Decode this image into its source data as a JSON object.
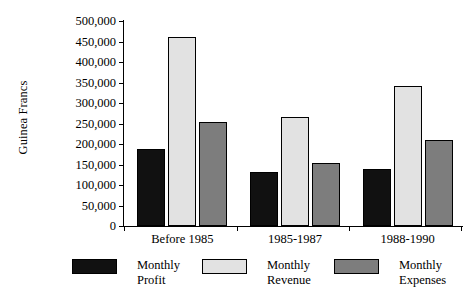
{
  "chart_data": {
    "type": "bar",
    "title": "",
    "xlabel": "",
    "ylabel": "Guinea Francs",
    "categories": [
      "Before 1985",
      "1985-1987",
      "1988-1990"
    ],
    "series": [
      {
        "name": "Monthly Profit",
        "color": "#111111",
        "values": [
          188000,
          132000,
          139000
        ]
      },
      {
        "name": "Monthly Revenue",
        "color": "#e2e2e2",
        "values": [
          461000,
          267000,
          341000
        ]
      },
      {
        "name": "Monthly Expenses",
        "color": "#7d7d7d",
        "values": [
          254000,
          154000,
          210000
        ]
      }
    ],
    "ylim": [
      0,
      500000
    ],
    "ytick_values": [
      0,
      50000,
      100000,
      150000,
      200000,
      250000,
      300000,
      350000,
      400000,
      450000,
      500000
    ],
    "ytick_labels": [
      "0",
      "50,000",
      "100,000",
      "150,000",
      "200,000",
      "250,000",
      "300,000",
      "350,000",
      "400,000",
      "450,000",
      "500,000"
    ],
    "grid": false,
    "legend_position": "bottom",
    "legend_entries": [
      {
        "label_line1": "Monthly",
        "label_line2": "Profit",
        "swatch": "black-swatch"
      },
      {
        "label_line1": "Monthly",
        "label_line2": "Revenue",
        "swatch": "light-gray-swatch"
      },
      {
        "label_line1": "Monthly",
        "label_line2": "Expenses",
        "swatch": "medium-gray-swatch"
      }
    ]
  }
}
